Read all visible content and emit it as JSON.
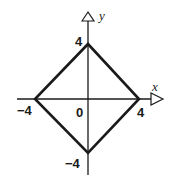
{
  "diagram": {
    "type": "coordinate-graph",
    "axes": {
      "x_label": "x",
      "y_label": "y",
      "origin_label": "0"
    },
    "tick_labels": {
      "y_top": "4",
      "y_bottom": "−4",
      "x_left": "−4",
      "x_right": "4"
    },
    "vertices": [
      {
        "name": "top",
        "x": 0,
        "y": 4
      },
      {
        "name": "right",
        "x": 4,
        "y": 0
      },
      {
        "name": "bottom",
        "x": 0,
        "y": -4
      },
      {
        "name": "left",
        "x": -4,
        "y": 0
      }
    ],
    "colors": {
      "stroke": "#1a1a1a",
      "background": "#ffffff"
    }
  }
}
